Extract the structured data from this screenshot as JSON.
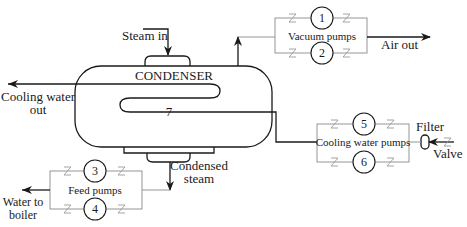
{
  "diagram": {
    "labels": {
      "steam_in": "Steam in",
      "condenser": "CONDENSER",
      "cooling_water_out_1": "Cooling water",
      "cooling_water_out_2": "out",
      "condenser_coil_number": "7",
      "vacuum_pumps": "Vacuum pumps",
      "air_out": "Air out",
      "cooling_water_pumps": "Cooling water pumps",
      "filter": "Filter",
      "valve": "Valve",
      "condensed_steam_1": "Condensed",
      "condensed_steam_2": "steam",
      "feed_pumps": "Feed pumps",
      "water_to_boiler_1": "Water to",
      "water_to_boiler_2": "boiler"
    },
    "pumps": [
      {
        "id": "1",
        "group": "Vacuum pumps"
      },
      {
        "id": "2",
        "group": "Vacuum pumps"
      },
      {
        "id": "3",
        "group": "Feed pumps"
      },
      {
        "id": "4",
        "group": "Feed pumps"
      },
      {
        "id": "5",
        "group": "Cooling water pumps"
      },
      {
        "id": "6",
        "group": "Cooling water pumps"
      }
    ],
    "colors": {
      "line": "#1a1a1a",
      "pipe_thin": "#8a8a8a",
      "valve": "#9a9a9a",
      "background": "#ffffff"
    }
  }
}
